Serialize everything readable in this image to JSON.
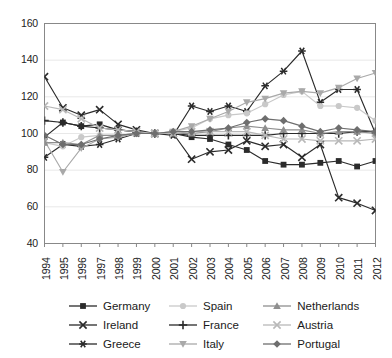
{
  "chart_data": {
    "type": "line",
    "title": "",
    "subtitle": "",
    "xlabel": "",
    "ylabel": "",
    "xlim": [
      1994,
      2012
    ],
    "ylim": [
      40,
      160
    ],
    "yticks": [
      40,
      60,
      80,
      100,
      120,
      140,
      160
    ],
    "grid": true,
    "grid_axis": "y",
    "legend_position": "bottom",
    "legend_columns": 3,
    "x": [
      1994,
      1995,
      1996,
      1997,
      1998,
      1999,
      2000,
      2001,
      2002,
      2003,
      2004,
      2005,
      2006,
      2007,
      2008,
      2009,
      2010,
      2011,
      2012
    ],
    "categories": [
      "1994",
      "1995",
      "1996",
      "1997",
      "1998",
      "1999",
      "2000",
      "2001",
      "2002",
      "2003",
      "2004",
      "2005",
      "2006",
      "2007",
      "2008",
      "2009",
      "2010",
      "2011",
      "2012"
    ],
    "series": [
      {
        "name": "Germany",
        "marker": "square",
        "color": "#2b2b2b",
        "values": [
          98,
          106,
          104,
          105,
          102,
          101,
          100,
          100,
          98,
          97,
          94,
          91,
          85,
          83,
          83,
          84,
          85,
          82,
          85
        ]
      },
      {
        "name": "Ireland",
        "marker": "x",
        "color": "#2b2b2b",
        "values": [
          131,
          114,
          110,
          113,
          105,
          102,
          100,
          100,
          86,
          90,
          91,
          96,
          93,
          94,
          87,
          94,
          65,
          62,
          58
        ]
      },
      {
        "name": "Greece",
        "marker": "asterisk",
        "color": "#2b2b2b",
        "values": [
          87,
          94,
          93,
          94,
          97,
          100,
          100,
          99,
          115,
          112,
          115,
          112,
          126,
          134,
          145,
          117,
          124,
          124,
          100
        ]
      },
      {
        "name": "Spain",
        "marker": "circle",
        "color": "#c9c9c9",
        "values": [
          95,
          93,
          98,
          99,
          99,
          100,
          100,
          101,
          103,
          108,
          110,
          111,
          116,
          121,
          123,
          115,
          115,
          114,
          107
        ]
      },
      {
        "name": "France",
        "marker": "plus",
        "color": "#2b2b2b",
        "values": [
          107,
          106,
          104,
          103,
          102,
          101,
          100,
          100,
          99,
          99,
          99,
          99,
          99,
          100,
          100,
          100,
          100,
          101,
          101
        ]
      },
      {
        "name": "Italy",
        "marker": "triangle-down",
        "color": "#a9a9a9",
        "values": [
          96,
          79,
          92,
          97,
          98,
          100,
          100,
          101,
          104,
          108,
          112,
          117,
          119,
          122,
          123,
          122,
          125,
          130,
          133
        ]
      },
      {
        "name": "Netherlands",
        "marker": "triangle-up",
        "color": "#8f8f8f",
        "values": [
          95,
          95,
          94,
          99,
          99,
          100,
          100,
          100,
          100,
          101,
          103,
          104,
          103,
          102,
          102,
          100,
          101,
          101,
          100
        ]
      },
      {
        "name": "Austria",
        "marker": "x-light",
        "color": "#b8b8b8",
        "values": [
          115,
          113,
          108,
          103,
          102,
          101,
          100,
          100,
          101,
          101,
          101,
          101,
          99,
          97,
          97,
          96,
          96,
          96,
          97
        ]
      },
      {
        "name": "Portugal",
        "marker": "diamond",
        "color": "#6e6e6e",
        "values": [
          99,
          94,
          94,
          97,
          99,
          100,
          100,
          101,
          101,
          102,
          103,
          106,
          108,
          107,
          104,
          101,
          103,
          102,
          101
        ]
      }
    ]
  },
  "axis": {
    "y_labels": [
      "160",
      "140",
      "120",
      "100",
      "80",
      "60",
      "40"
    ],
    "x_labels": [
      "1994",
      "1995",
      "1996",
      "1997",
      "1998",
      "1999",
      "2000",
      "2001",
      "2002",
      "2003",
      "2004",
      "2005",
      "2006",
      "2007",
      "2008",
      "2009",
      "2010",
      "2011",
      "2012"
    ]
  },
  "legend": {
    "items": [
      {
        "label": "Germany",
        "marker": "square",
        "color": "#2b2b2b"
      },
      {
        "label": "Spain",
        "marker": "circle",
        "color": "#c9c9c9"
      },
      {
        "label": "Netherlands",
        "marker": "triangle-up",
        "color": "#8f8f8f"
      },
      {
        "label": "Ireland",
        "marker": "x",
        "color": "#2b2b2b"
      },
      {
        "label": "France",
        "marker": "plus",
        "color": "#2b2b2b"
      },
      {
        "label": "Austria",
        "marker": "x-light",
        "color": "#b8b8b8"
      },
      {
        "label": "Greece",
        "marker": "asterisk",
        "color": "#2b2b2b"
      },
      {
        "label": "Italy",
        "marker": "triangle-down",
        "color": "#a9a9a9"
      },
      {
        "label": "Portugal",
        "marker": "diamond",
        "color": "#6e6e6e"
      }
    ]
  }
}
